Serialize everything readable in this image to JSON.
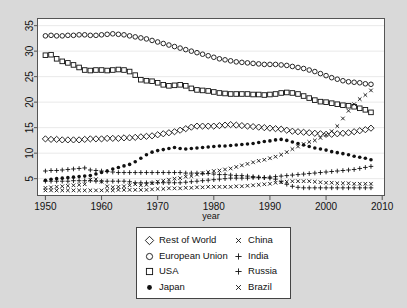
{
  "chart_data": {
    "type": "scatter",
    "title": "",
    "xlabel": "year",
    "ylabel": "",
    "xlim": [
      1948.5,
      2010.5
    ],
    "ylim": [
      1.6,
      36.5
    ],
    "xticks": [
      1950,
      1960,
      1970,
      1980,
      1990,
      2000,
      2010
    ],
    "yticks": [
      5,
      10,
      15,
      20,
      25,
      30,
      35
    ],
    "grid": true,
    "legend_position": "below-center",
    "x": [
      1950,
      1951,
      1952,
      1953,
      1954,
      1955,
      1956,
      1957,
      1958,
      1959,
      1960,
      1961,
      1962,
      1963,
      1964,
      1965,
      1966,
      1967,
      1968,
      1969,
      1970,
      1971,
      1972,
      1973,
      1974,
      1975,
      1976,
      1977,
      1978,
      1979,
      1980,
      1981,
      1982,
      1983,
      1984,
      1985,
      1986,
      1987,
      1988,
      1989,
      1990,
      1991,
      1992,
      1993,
      1994,
      1995,
      1996,
      1997,
      1998,
      1999,
      2000,
      2001,
      2002,
      2003,
      2004,
      2005,
      2006,
      2007,
      2008
    ],
    "series": [
      {
        "name": "Rest of World",
        "marker": "open-diamond",
        "values": [
          12.8,
          12.7,
          12.7,
          12.6,
          12.6,
          12.6,
          12.6,
          12.7,
          12.8,
          12.8,
          12.8,
          12.9,
          12.9,
          12.9,
          13.0,
          13.0,
          13.1,
          13.2,
          13.3,
          13.4,
          13.6,
          13.8,
          14.0,
          14.2,
          14.5,
          14.8,
          15.1,
          15.3,
          15.3,
          15.3,
          15.3,
          15.4,
          15.5,
          15.6,
          15.5,
          15.4,
          15.3,
          15.2,
          15.1,
          15.0,
          14.9,
          14.8,
          14.7,
          14.5,
          14.3,
          14.2,
          14.1,
          14.0,
          13.9,
          13.8,
          13.7,
          13.7,
          13.8,
          13.9,
          14.0,
          14.2,
          14.4,
          14.6,
          14.9
        ]
      },
      {
        "name": "European Union",
        "marker": "open-circle",
        "values": [
          33.0,
          33.1,
          33.0,
          33.0,
          33.1,
          33.1,
          33.2,
          33.2,
          33.1,
          33.1,
          33.2,
          33.3,
          33.4,
          33.3,
          33.2,
          33.0,
          32.8,
          32.6,
          32.4,
          32.1,
          31.8,
          31.5,
          31.2,
          30.9,
          30.6,
          30.3,
          30.0,
          29.7,
          29.4,
          29.1,
          28.8,
          28.5,
          28.3,
          28.1,
          27.9,
          27.8,
          27.7,
          27.6,
          27.5,
          27.4,
          27.4,
          27.4,
          27.3,
          27.2,
          27.0,
          26.8,
          26.6,
          26.3,
          26.0,
          25.6,
          25.2,
          24.8,
          24.5,
          24.2,
          24.0,
          23.9,
          23.8,
          23.6,
          23.5
        ]
      },
      {
        "name": "USA",
        "marker": "open-square",
        "values": [
          29.2,
          29.3,
          28.5,
          28.0,
          27.7,
          27.3,
          26.8,
          26.3,
          26.2,
          26.3,
          26.3,
          26.2,
          26.3,
          26.4,
          26.3,
          26.0,
          25.3,
          24.4,
          24.2,
          24.1,
          23.8,
          23.4,
          23.2,
          23.3,
          23.4,
          23.2,
          22.7,
          22.4,
          22.3,
          22.2,
          22.0,
          21.8,
          21.7,
          21.6,
          21.6,
          21.6,
          21.6,
          21.5,
          21.5,
          21.4,
          21.5,
          21.6,
          21.8,
          21.9,
          21.8,
          21.6,
          21.2,
          20.8,
          20.4,
          20.1,
          20.0,
          19.8,
          19.6,
          19.4,
          19.3,
          19.1,
          18.8,
          18.5,
          18.0
        ]
      },
      {
        "name": "Japan",
        "marker": "filled-circle",
        "values": [
          4.7,
          4.9,
          5.0,
          5.1,
          5.2,
          5.3,
          5.4,
          5.5,
          5.6,
          5.9,
          6.2,
          6.5,
          6.9,
          7.2,
          7.5,
          7.8,
          8.3,
          9.0,
          9.7,
          10.2,
          10.5,
          10.7,
          10.9,
          11.1,
          10.9,
          10.8,
          10.9,
          11.0,
          11.1,
          11.2,
          11.3,
          11.4,
          11.4,
          11.5,
          11.6,
          11.7,
          11.8,
          11.9,
          12.1,
          12.3,
          12.4,
          12.6,
          12.7,
          12.5,
          12.2,
          11.9,
          11.6,
          11.3,
          11.0,
          10.8,
          10.6,
          10.3,
          10.1,
          9.9,
          9.7,
          9.4,
          9.2,
          9.0,
          8.7
        ]
      },
      {
        "name": "China",
        "marker": "x-cross",
        "values": [
          3.2,
          3.3,
          3.4,
          3.5,
          3.6,
          3.7,
          3.8,
          3.9,
          4.8,
          4.9,
          4.4,
          3.5,
          3.3,
          3.4,
          3.5,
          3.7,
          3.9,
          3.7,
          3.8,
          4.1,
          4.4,
          4.6,
          4.8,
          5.0,
          5.1,
          5.4,
          5.5,
          5.8,
          6.1,
          6.3,
          6.5,
          6.6,
          6.8,
          7.0,
          7.3,
          7.6,
          7.9,
          8.2,
          8.5,
          8.7,
          9.0,
          9.3,
          9.7,
          10.2,
          10.8,
          11.3,
          11.8,
          12.2,
          12.5,
          13.0,
          13.6,
          14.3,
          15.3,
          16.8,
          18.3,
          19.6,
          20.6,
          21.4,
          22.3
        ]
      },
      {
        "name": "India",
        "marker": "plus",
        "values": [
          4.5,
          4.5,
          4.5,
          4.5,
          4.5,
          4.6,
          4.6,
          4.6,
          4.6,
          4.5,
          4.5,
          4.5,
          4.5,
          4.5,
          4.5,
          4.4,
          4.2,
          4.2,
          4.2,
          4.2,
          4.2,
          4.2,
          4.2,
          4.2,
          4.2,
          4.3,
          4.4,
          4.5,
          4.6,
          4.7,
          4.8,
          4.9,
          5.0,
          5.1,
          5.1,
          5.1,
          5.1,
          5.2,
          5.2,
          5.2,
          5.3,
          5.4,
          5.5,
          5.6,
          5.7,
          5.8,
          5.9,
          6.0,
          6.1,
          6.2,
          6.3,
          6.4,
          6.5,
          6.6,
          6.7,
          6.8,
          7.0,
          7.2,
          7.4
        ]
      },
      {
        "name": "Russia",
        "marker": "plus",
        "values": [
          6.5,
          6.6,
          6.6,
          6.7,
          6.8,
          6.9,
          7.0,
          7.1,
          6.7,
          6.6,
          6.5,
          6.4,
          6.3,
          6.2,
          6.2,
          6.2,
          6.2,
          6.2,
          6.2,
          6.2,
          6.2,
          6.2,
          6.2,
          6.2,
          6.2,
          6.1,
          6.1,
          6.1,
          6.0,
          6.0,
          5.9,
          5.8,
          5.8,
          5.7,
          5.6,
          5.6,
          5.5,
          5.4,
          5.3,
          5.2,
          5.1,
          4.9,
          4.4,
          3.9,
          3.5,
          3.3,
          3.2,
          3.2,
          3.2,
          3.2,
          3.2,
          3.2,
          3.2,
          3.2,
          3.2,
          3.2,
          3.2,
          3.2,
          3.2
        ]
      },
      {
        "name": "Brazil",
        "marker": "x-cross",
        "values": [
          2.7,
          2.7,
          2.7,
          2.7,
          2.7,
          2.7,
          2.7,
          2.7,
          2.7,
          2.7,
          2.7,
          2.7,
          2.7,
          2.8,
          2.8,
          2.8,
          2.8,
          2.8,
          2.8,
          2.9,
          3.0,
          3.0,
          3.1,
          3.1,
          3.1,
          3.2,
          3.2,
          3.3,
          3.3,
          3.4,
          3.4,
          3.4,
          3.4,
          3.4,
          3.5,
          3.5,
          3.6,
          3.7,
          3.8,
          3.9,
          4.0,
          4.2,
          4.3,
          4.4,
          4.5,
          4.5,
          4.5,
          4.5,
          4.4,
          4.3,
          4.2,
          4.2,
          4.1,
          4.1,
          4.1,
          4.0,
          4.0,
          4.0,
          4.0
        ]
      }
    ]
  },
  "axis": {
    "x_title": "year",
    "x_ticks": [
      "1950",
      "1960",
      "1970",
      "1980",
      "1990",
      "2000",
      "2010"
    ],
    "y_ticks": [
      "5",
      "10",
      "15",
      "20",
      "25",
      "30",
      "35"
    ]
  },
  "legend": {
    "left_column": [
      {
        "label": "Rest of World",
        "marker": "open-diamond"
      },
      {
        "label": "European Union",
        "marker": "open-circle"
      },
      {
        "label": "USA",
        "marker": "open-square"
      },
      {
        "label": "Japan",
        "marker": "filled-circle"
      }
    ],
    "right_column": [
      {
        "label": "China",
        "marker": "x-cross"
      },
      {
        "label": "India",
        "marker": "plus"
      },
      {
        "label": "Russia",
        "marker": "plus"
      },
      {
        "label": "Brazil",
        "marker": "x-cross"
      }
    ]
  },
  "colors": {
    "background": "#d9d9d9",
    "plot_background": "#ffffff",
    "marker": "#111111",
    "grid": "#e9e9e9",
    "axis": "#555555"
  }
}
